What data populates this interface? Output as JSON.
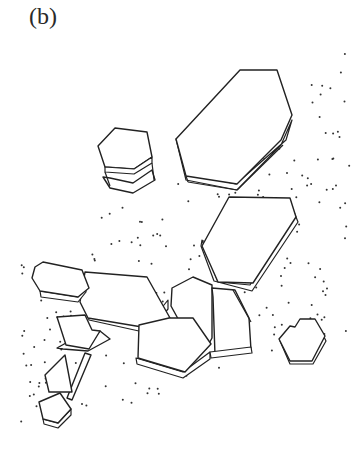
{
  "figure": {
    "panel_label": "(b)",
    "colors": {
      "line": "#222222",
      "stipple": "#333333",
      "background": "#ffffff"
    },
    "crystals": [
      {
        "id": "large-top-right",
        "label": ""
      },
      {
        "id": "small-stacked-top-left",
        "label": ""
      },
      {
        "id": "middle-right",
        "label": ""
      },
      {
        "id": "left-cluster",
        "label": ""
      },
      {
        "id": "center-cluster",
        "label": ""
      },
      {
        "id": "small-right",
        "label": ""
      },
      {
        "id": "bottom-left",
        "label": ""
      }
    ]
  }
}
